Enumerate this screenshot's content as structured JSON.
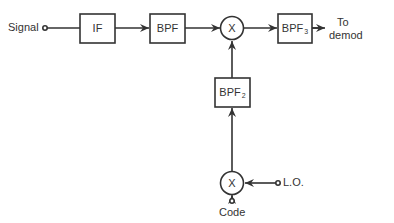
{
  "diagram": {
    "type": "block-diagram",
    "inputs": {
      "signal": "Signal",
      "lo": "L.O.",
      "code": "Code"
    },
    "blocks": {
      "if": {
        "label": "IF"
      },
      "bpf": {
        "label": "BPF"
      },
      "mixer_top": {
        "label": "X"
      },
      "bpf3": {
        "label": "BPF",
        "subscript": "3"
      },
      "bpf2": {
        "label": "BPF",
        "subscript": "2"
      },
      "mixer_bottom": {
        "label": "X"
      }
    },
    "output": {
      "line1": "To",
      "line2": "demod"
    },
    "colors": {
      "stroke": "#333333",
      "background": "#ffffff"
    }
  }
}
